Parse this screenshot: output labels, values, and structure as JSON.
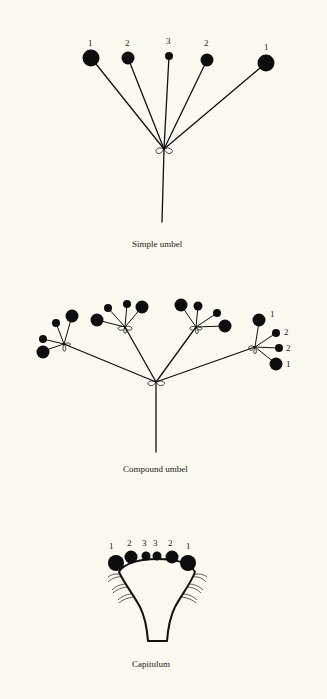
{
  "figures": {
    "simple_umbel": {
      "caption": "Simple umbel",
      "labels": [
        "1",
        "2",
        "3",
        "2",
        "1"
      ]
    },
    "compound_umbel": {
      "caption": "Compound umbel",
      "right_umbellet_labels": [
        "1",
        "2",
        "2",
        "1"
      ]
    },
    "capitulum": {
      "caption": "Capitulum",
      "labels": [
        "1",
        "2",
        "3",
        "3",
        "2",
        "1"
      ]
    }
  },
  "colors": {
    "background": "#fbf9f0",
    "ink": "#111111"
  }
}
